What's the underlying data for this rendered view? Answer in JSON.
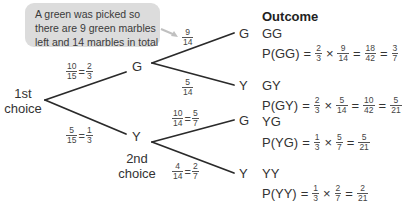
{
  "callout": {
    "lines": [
      "A green was picked so",
      "there are 9 green marbles",
      "left and 14 marbles in total"
    ],
    "color": "#dcdcdc"
  },
  "tree": {
    "root_label_line1": "1st",
    "root_label_line2": "choice",
    "second_label_line1": "2nd",
    "second_label_line2": "choice",
    "first_level": {
      "G": {
        "node": "G",
        "prob": {
          "num": "10",
          "den": "15",
          "simp_num": "2",
          "simp_den": "3"
        }
      },
      "Y": {
        "node": "Y",
        "prob": {
          "num": "5",
          "den": "15",
          "simp_num": "1",
          "simp_den": "3"
        }
      }
    },
    "second_level": {
      "GG": {
        "node": "G",
        "prob": {
          "num": "9",
          "den": "14"
        }
      },
      "GY": {
        "node": "Y",
        "prob": {
          "num": "5",
          "den": "14"
        }
      },
      "YG": {
        "node": "G",
        "prob": {
          "num": "10",
          "den": "14",
          "simp_num": "5",
          "simp_den": "7"
        }
      },
      "YY": {
        "node": "Y",
        "prob": {
          "num": "4",
          "den": "14",
          "simp_num": "2",
          "simp_den": "7"
        }
      }
    }
  },
  "outcomes": {
    "title": "Outcome",
    "items": [
      {
        "name": "GG",
        "plabel": "P(GG)",
        "a": [
          "2",
          "3"
        ],
        "b": [
          "9",
          "14"
        ],
        "r1": [
          "18",
          "42"
        ],
        "r2": [
          "3",
          "7"
        ]
      },
      {
        "name": "GY",
        "plabel": "P(GY)",
        "a": [
          "2",
          "3"
        ],
        "b": [
          "5",
          "14"
        ],
        "r1": [
          "10",
          "42"
        ],
        "r2": [
          "5",
          "21"
        ]
      },
      {
        "name": "YG",
        "plabel": "P(YG)",
        "a": [
          "1",
          "3"
        ],
        "b": [
          "5",
          "7"
        ],
        "r1": [
          "5",
          "21"
        ]
      },
      {
        "name": "YY",
        "plabel": "P(YY)",
        "a": [
          "1",
          "3"
        ],
        "b": [
          "2",
          "7"
        ],
        "r1": [
          "2",
          "21"
        ]
      }
    ],
    "symbols": {
      "eq": "=",
      "times": "×"
    }
  }
}
